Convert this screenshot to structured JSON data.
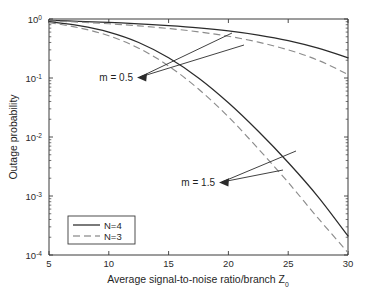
{
  "chart_data": {
    "type": "line",
    "title": "",
    "xlabel": "Average signal-to-noise ratio/branch Z",
    "xlabel_sub": "0",
    "ylabel": "Outage probability",
    "xlim": [
      5,
      30
    ],
    "ylim": [
      0.0001,
      1
    ],
    "yscale": "log",
    "xscale": "linear",
    "grid": false,
    "xticks": [
      "5",
      "10",
      "15",
      "20",
      "25",
      "30"
    ],
    "xtick_values": [
      5,
      10,
      15,
      20,
      25,
      30
    ],
    "yticks": [
      "10^0",
      "10^-1",
      "10^-2",
      "10^-3",
      "10^-4"
    ],
    "ytick_mantissa": "10",
    "ytick_exponents": [
      "0",
      "-1",
      "-2",
      "-3",
      "-4"
    ],
    "ytick_values": [
      1,
      0.1,
      0.01,
      0.001,
      0.0001
    ],
    "legend_position": "lower left",
    "legend": [
      {
        "label": "N=4",
        "style": "solid"
      },
      {
        "label": "N=3",
        "style": "dashed"
      }
    ],
    "annotations": [
      {
        "text": "m = 0.5",
        "x": 11.6,
        "y": 0.16
      },
      {
        "text": "m = 1.5",
        "x": 19.4,
        "y": 0.0019
      }
    ],
    "series": [
      {
        "name": "m = 0.5, N=4",
        "group": "m = 0.5",
        "style": "solid",
        "x": [
          5,
          7.5,
          10,
          12.5,
          15,
          17.5,
          20,
          22.5,
          25,
          27.5,
          30
        ],
        "values": [
          0.95,
          0.915,
          0.875,
          0.83,
          0.775,
          0.71,
          0.63,
          0.535,
          0.43,
          0.32,
          0.22
        ]
      },
      {
        "name": "m = 0.5, N=3",
        "group": "m = 0.5",
        "style": "dashed",
        "x": [
          5,
          7.5,
          10,
          12.5,
          15,
          17.5,
          20,
          22.5,
          25,
          27.5,
          30
        ],
        "values": [
          0.93,
          0.885,
          0.83,
          0.765,
          0.69,
          0.605,
          0.51,
          0.405,
          0.3,
          0.2,
          0.115
        ]
      },
      {
        "name": "m = 1.5, N=4",
        "group": "m = 1.5",
        "style": "solid",
        "x": [
          5,
          7.5,
          10,
          12.5,
          15,
          17.5,
          20,
          22.5,
          25,
          27.5,
          30
        ],
        "values": [
          0.9,
          0.77,
          0.6,
          0.4,
          0.22,
          0.1,
          0.038,
          0.0125,
          0.0037,
          0.00097,
          0.00021
        ]
      },
      {
        "name": "m = 1.5, N=3",
        "group": "m = 1.5",
        "style": "dashed",
        "x": [
          5,
          7.5,
          10,
          12.5,
          15,
          17.5,
          20,
          22.5,
          25,
          27.5,
          30
        ],
        "values": [
          0.87,
          0.71,
          0.52,
          0.32,
          0.16,
          0.065,
          0.022,
          0.0063,
          0.0017,
          0.00042,
          0.00011
        ]
      }
    ]
  },
  "axis": {
    "x_label_text": "Average signal-to-noise ratio/branch Z",
    "x_label_subscript": "0",
    "y_label_text": "Outage probability"
  },
  "colors": {
    "solid_curve": "#2b2b2b",
    "dashed_curve": "#8c8c8c",
    "axis": "#3a3a3a",
    "background": "#ffffff",
    "text": "#1f1f1f"
  }
}
